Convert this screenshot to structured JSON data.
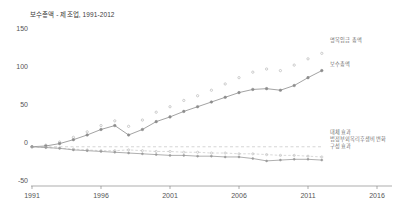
{
  "chart_data": {
    "type": "line",
    "title": "보수총액 - 제조업, 1991-2012",
    "xlabel": "",
    "ylabel": "",
    "xlim": [
      1991,
      2016
    ],
    "ylim": [
      -50,
      150
    ],
    "yticks": [
      150,
      100,
      50,
      0,
      -50
    ],
    "xticks": [
      1991,
      1996,
      2001,
      2006,
      2011,
      2016
    ],
    "grid": false,
    "legend_position": "right-inline",
    "x": [
      1991,
      1992,
      1993,
      1994,
      1995,
      1996,
      1997,
      1998,
      1999,
      2000,
      2001,
      2002,
      2003,
      2004,
      2005,
      2006,
      2007,
      2008,
      2009,
      2010,
      2011,
      2012
    ],
    "series": [
      {
        "name": "명목임금 총액",
        "label": "명목임금 총액",
        "style": "dotted-markers",
        "color": "#b9b9b9",
        "values": [
          0,
          2,
          6,
          12,
          19,
          27,
          33,
          26,
          34,
          44,
          51,
          59,
          65,
          72,
          80,
          88,
          95,
          99,
          97,
          104,
          112,
          119
        ]
      },
      {
        "name": "보수총액",
        "label": "보수총액",
        "style": "solid-markers",
        "color": "#8c8c8c",
        "values": [
          0,
          1,
          4,
          9,
          15,
          22,
          27,
          15,
          22,
          32,
          38,
          45,
          51,
          57,
          63,
          69,
          73,
          74,
          72,
          78,
          88,
          97
        ]
      },
      {
        "name": "대체 효과",
        "label": "대체 효과",
        "style": "dashed",
        "color": "#c4c4c4",
        "values": [
          0,
          0,
          0,
          0,
          0,
          0,
          0,
          0,
          0,
          0,
          0,
          0,
          0,
          0,
          0,
          0,
          0,
          0,
          0,
          0,
          0,
          0
        ]
      },
      {
        "name": "법정부외복리후생비 변화",
        "label": "법정부외복리후생비 변화",
        "style": "dashed-markers",
        "color": "#bdbdbd",
        "values": [
          0,
          -1,
          -2,
          -3,
          -4,
          -5,
          -5,
          -4,
          -5,
          -6,
          -6,
          -7,
          -7,
          -8,
          -8,
          -9,
          -9,
          -10,
          -11,
          -11,
          -12,
          -13
        ]
      },
      {
        "name": "구성 효과",
        "label": "구성 효과",
        "style": "solid-markers-small",
        "color": "#9a9a9a",
        "values": [
          0,
          -1,
          -2,
          -4,
          -5,
          -6,
          -7,
          -8,
          -9,
          -10,
          -11,
          -11,
          -12,
          -12,
          -13,
          -13,
          -15,
          -18,
          -17,
          -16,
          -16,
          -17
        ]
      }
    ],
    "axis_color": "#808080",
    "text_color": "#555555"
  },
  "labels": {
    "y": [
      "150",
      "100",
      "50",
      "0",
      "-50"
    ],
    "x": [
      "1991",
      "1996",
      "2001",
      "2006",
      "2011",
      "2016"
    ]
  },
  "inline_labels": {
    "top": "명목임금 총액",
    "second": "보수총액",
    "b1": "대체 효과",
    "b2": "법정부외복리후생비 변화",
    "b3": "구성 효과"
  }
}
